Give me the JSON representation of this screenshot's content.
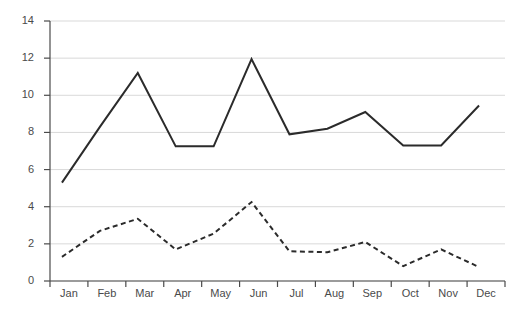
{
  "chart_data": {
    "type": "line",
    "title": "",
    "subtitle": "",
    "xlabel": "",
    "ylabel": "",
    "categories": [
      "Jan",
      "Feb",
      "Mar",
      "Apr",
      "May",
      "Jun",
      "Jul",
      "Aug",
      "Sep",
      "Oct",
      "Nov",
      "Dec"
    ],
    "series": [
      {
        "name": "Series 1",
        "style": "solid",
        "color": "#2b2b2b",
        "values": [
          5.3,
          8.3,
          11.2,
          7.25,
          7.25,
          11.95,
          7.9,
          8.2,
          9.1,
          7.3,
          7.3,
          9.45
        ]
      },
      {
        "name": "Series 2",
        "style": "dashed",
        "color": "#2b2b2b",
        "values": [
          1.3,
          2.7,
          3.35,
          1.7,
          2.55,
          4.25,
          1.6,
          1.55,
          2.1,
          0.8,
          1.7,
          0.75
        ]
      }
    ],
    "ylim": [
      0,
      14
    ],
    "yticks": [
      0,
      2,
      4,
      6,
      8,
      10,
      12,
      14
    ],
    "ytick_labels": [
      "0",
      "2",
      "4",
      "6",
      "8",
      "10",
      "12",
      "14"
    ],
    "xtick_labels": [
      "Jan",
      "Feb",
      "Mar",
      "Apr",
      "May",
      "Jun",
      "Jul",
      "Aug",
      "Sep",
      "Oct",
      "Nov",
      "Dec"
    ],
    "grid": true,
    "grid_axis": "y",
    "grid_color": "#d9d9d9",
    "axis_color": "#4a4a4a",
    "legend": false,
    "legend_position": "none",
    "background": "#ffffff"
  }
}
